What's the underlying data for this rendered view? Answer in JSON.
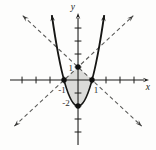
{
  "figure": {
    "width": 156,
    "height": 150,
    "bg": "#fdfdfc"
  },
  "chart_data": {
    "type": "line",
    "title": "",
    "axes": {
      "xlabel": "x",
      "ylabel": "y",
      "xlim": [
        -4.86,
        5.0
      ],
      "ylim": [
        -5.0,
        5.08
      ],
      "x_ticks": [
        -4,
        -3,
        -2,
        -1,
        1,
        2,
        3,
        4
      ],
      "y_ticks": [
        -4,
        -3,
        -2,
        -1,
        1,
        2,
        3,
        4
      ],
      "grid": false
    },
    "series": [
      {
        "name": "parabola",
        "equation": "y = 2x^2 - 2",
        "style": "solid",
        "kind": "parabola",
        "a": 2,
        "c": -2,
        "x_from": -1.871,
        "x_to": 1.871,
        "width": 1.9
      },
      {
        "name": "line-positive-slope",
        "equation": "y = x + 1",
        "style": "dashed",
        "kind": "line",
        "slope": 1,
        "intercept": 1,
        "x_from": -4.55,
        "x_to": 3.95,
        "width": 1.1
      },
      {
        "name": "line-negative-slope",
        "equation": "y = -x + 1",
        "style": "dashed",
        "kind": "line",
        "slope": -1,
        "intercept": 1,
        "x_from": -3.95,
        "x_to": 4.55,
        "width": 1.1
      }
    ],
    "marked_points": [
      {
        "x": -1,
        "y": 0
      },
      {
        "x": 1,
        "y": 0
      },
      {
        "x": 0,
        "y": 1
      },
      {
        "x": 0,
        "y": -2
      }
    ],
    "point_labels": [
      {
        "text": "1",
        "x": 0,
        "y": 1,
        "side": "left"
      },
      {
        "text": "-1",
        "x": -1,
        "y": 0,
        "side": "below"
      },
      {
        "text": "1",
        "x": 1,
        "y": 0,
        "side": "below"
      },
      {
        "text": "-2",
        "x": 0,
        "y": -2,
        "side": "left"
      }
    ],
    "shaded_region": {
      "upper_boundary": [
        [
          -1,
          0
        ],
        [
          0,
          1
        ],
        [
          1,
          0
        ]
      ],
      "lower_boundary": "parabola y = 2x^2 - 2 from x = 1 back to x = -1",
      "fill": "#dbdbd9"
    },
    "colors": {
      "axis": "#1d1d1b",
      "curve": "#161614",
      "dashed": "#5a5a58",
      "arrow_dashed": "#3a3a38",
      "dot": "#111110",
      "shade": "#dbdbd9",
      "label": "#2a2a28"
    }
  }
}
